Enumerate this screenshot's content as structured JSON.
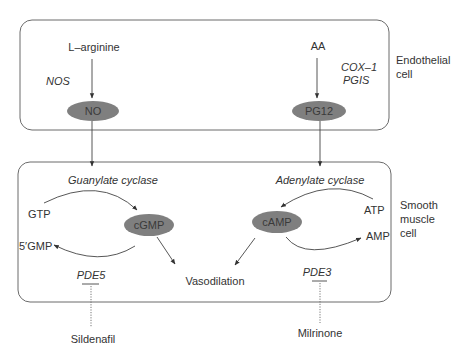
{
  "compartments": {
    "endothelial": {
      "label_line1": "Endothelial",
      "label_line2": "cell"
    },
    "smooth_muscle": {
      "label_line1": "Smooth",
      "label_line2": "muscle",
      "label_line3": "cell"
    }
  },
  "nodes": {
    "no": "NO",
    "pg12": "PG12",
    "cgmp": "cGMP",
    "camp": "cAMP"
  },
  "labels": {
    "l_arginine": "L–arginine",
    "aa": "AA",
    "nos": "NOS",
    "cox1": "COX–1",
    "pgis": "PGIS",
    "guanylate_cyclase": "Guanylate cyclase",
    "adenylate_cyclase": "Adenylate cyclase",
    "gtp": "GTP",
    "five_gmp": "5′GMP",
    "atp": "ATP",
    "amp": "AMP",
    "pde5": "PDE5",
    "pde3": "PDE3",
    "vasodilation": "Vasodilation",
    "sildenafil": "Sildenafil",
    "milrinone": "Milrinone"
  },
  "colors": {
    "node_fill": "#7f7f7f",
    "box_stroke": "#6b6b6b",
    "text": "#333333"
  }
}
